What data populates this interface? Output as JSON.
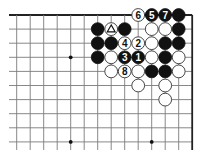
{
  "diagram": {
    "type": "go-board-corner",
    "corner": "upper-right",
    "grid": {
      "origin_x": 16.7,
      "origin_y": 15,
      "spacing_x": 13.5,
      "spacing_y": 14.1,
      "columns": 14,
      "rows": 10,
      "left_extent": 9,
      "bottom_extent": 150
    },
    "edges": [
      "top",
      "right"
    ],
    "star_points": [
      {
        "col": 4,
        "row": 3
      },
      {
        "col": 4,
        "row": 9
      },
      {
        "col": 10,
        "row": 9
      }
    ],
    "stones": [
      {
        "col": 6,
        "row": 1,
        "color": "black"
      },
      {
        "col": 7,
        "row": 1,
        "color": "white",
        "mark": "triangle"
      },
      {
        "col": 8,
        "row": 1,
        "color": "black"
      },
      {
        "col": 6,
        "row": 2,
        "color": "black"
      },
      {
        "col": 7,
        "row": 2,
        "color": "black"
      },
      {
        "col": 8,
        "row": 2,
        "color": "white",
        "label": "4"
      },
      {
        "col": 9,
        "row": 2,
        "color": "white",
        "label": "2"
      },
      {
        "col": 6,
        "row": 3,
        "color": "black"
      },
      {
        "col": 7,
        "row": 3,
        "color": "white"
      },
      {
        "col": 8,
        "row": 3,
        "color": "black",
        "label": "3"
      },
      {
        "col": 9,
        "row": 3,
        "color": "black",
        "label": "1"
      },
      {
        "col": 7,
        "row": 4,
        "color": "white"
      },
      {
        "col": 8,
        "row": 4,
        "color": "white",
        "label": "8"
      },
      {
        "col": 9,
        "row": 4,
        "color": "white"
      },
      {
        "col": 9,
        "row": 0,
        "color": "white",
        "label": "6"
      },
      {
        "col": 10,
        "row": 0,
        "color": "black",
        "label": "5"
      },
      {
        "col": 11,
        "row": 0,
        "color": "black",
        "label": "7"
      },
      {
        "col": 12,
        "row": 0,
        "color": "black"
      },
      {
        "col": 10,
        "row": 1,
        "color": "white"
      },
      {
        "col": 11,
        "row": 1,
        "color": "white"
      },
      {
        "col": 12,
        "row": 1,
        "color": "black"
      },
      {
        "col": 10,
        "row": 2,
        "color": "white"
      },
      {
        "col": 11,
        "row": 2,
        "color": "black"
      },
      {
        "col": 12,
        "row": 2,
        "color": "black"
      },
      {
        "col": 10,
        "row": 3,
        "color": "white"
      },
      {
        "col": 11,
        "row": 3,
        "color": "black"
      },
      {
        "col": 12,
        "row": 3,
        "color": "white"
      },
      {
        "col": 10,
        "row": 4,
        "color": "black"
      },
      {
        "col": 11,
        "row": 4,
        "color": "black"
      },
      {
        "col": 12,
        "row": 4,
        "color": "white"
      },
      {
        "col": 9,
        "row": 5,
        "color": "white"
      },
      {
        "col": 11,
        "row": 5,
        "color": "white"
      },
      {
        "col": 11,
        "row": 6,
        "color": "white"
      }
    ],
    "move_labels": [
      "1",
      "2",
      "3",
      "4",
      "5",
      "6",
      "7",
      "8"
    ],
    "colors": {
      "black_stone": "#111111",
      "white_stone": "#ffffff",
      "grid": "#7a7a7a",
      "edge": "#222222"
    }
  }
}
